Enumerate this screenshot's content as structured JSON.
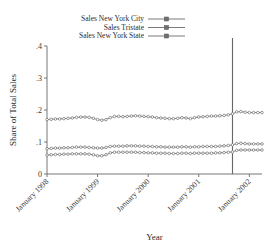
{
  "chart_data": {
    "type": "line",
    "title": "",
    "xlabel": "Year",
    "ylabel": "Share of Total Sales",
    "ylim": [
      0,
      0.4
    ],
    "ytick_labels": [
      "0",
      ".1",
      ".2",
      ".3",
      ".4"
    ],
    "ytick_values": [
      0,
      0.1,
      0.2,
      0.3,
      0.4
    ],
    "xtick_labels": [
      "January 1998",
      "January 1999",
      "January 2000",
      "January 2001",
      "January 2002"
    ],
    "xtick_values": [
      0,
      12,
      24,
      36,
      48
    ],
    "xlim": [
      0,
      51
    ],
    "grid": false,
    "legend_position": "top-center",
    "annotations": [
      {
        "name": "reference-line",
        "type": "vline",
        "x": 44
      }
    ],
    "series": [
      {
        "name": "Sales New York City",
        "marker": "circle",
        "color": "#6b6b6b",
        "values": [
          0.17,
          0.171,
          0.172,
          0.172,
          0.173,
          0.174,
          0.175,
          0.177,
          0.178,
          0.178,
          0.177,
          0.174,
          0.17,
          0.168,
          0.17,
          0.176,
          0.18,
          0.18,
          0.179,
          0.18,
          0.181,
          0.182,
          0.181,
          0.18,
          0.179,
          0.178,
          0.176,
          0.175,
          0.174,
          0.173,
          0.173,
          0.174,
          0.176,
          0.175,
          0.173,
          0.176,
          0.178,
          0.179,
          0.18,
          0.181,
          0.181,
          0.182,
          0.183,
          0.185,
          0.188,
          0.194,
          0.195,
          0.193,
          0.192,
          0.192,
          0.192,
          0.192
        ]
      },
      {
        "name": "Sales Tristate",
        "marker": "circle",
        "color": "#6b6b6b",
        "values": [
          0.079,
          0.08,
          0.081,
          0.081,
          0.082,
          0.082,
          0.083,
          0.084,
          0.084,
          0.084,
          0.083,
          0.082,
          0.081,
          0.081,
          0.083,
          0.086,
          0.087,
          0.087,
          0.087,
          0.088,
          0.088,
          0.088,
          0.087,
          0.087,
          0.086,
          0.086,
          0.085,
          0.085,
          0.084,
          0.084,
          0.084,
          0.084,
          0.085,
          0.085,
          0.084,
          0.085,
          0.085,
          0.086,
          0.086,
          0.086,
          0.086,
          0.087,
          0.088,
          0.089,
          0.091,
          0.095,
          0.096,
          0.095,
          0.094,
          0.094,
          0.094,
          0.094
        ]
      },
      {
        "name": "Sales New York State",
        "marker": "circle",
        "color": "#6b6b6b",
        "values": [
          0.059,
          0.06,
          0.061,
          0.061,
          0.062,
          0.062,
          0.063,
          0.063,
          0.063,
          0.063,
          0.062,
          0.06,
          0.057,
          0.057,
          0.06,
          0.066,
          0.068,
          0.068,
          0.068,
          0.068,
          0.068,
          0.068,
          0.067,
          0.067,
          0.066,
          0.066,
          0.065,
          0.065,
          0.065,
          0.064,
          0.064,
          0.064,
          0.065,
          0.065,
          0.064,
          0.065,
          0.065,
          0.065,
          0.065,
          0.065,
          0.066,
          0.066,
          0.067,
          0.068,
          0.069,
          0.074,
          0.075,
          0.075,
          0.075,
          0.075,
          0.075,
          0.075
        ]
      }
    ]
  },
  "legend": {
    "entries": [
      {
        "label": "Sales New York City"
      },
      {
        "label": "Sales Tristate"
      },
      {
        "label": "Sales New York State"
      }
    ]
  }
}
